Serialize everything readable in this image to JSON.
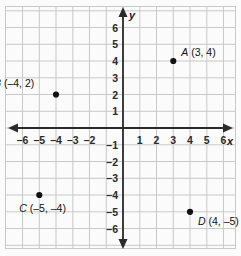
{
  "figure": {
    "type": "coordinate-plane",
    "background_color": "#fbfbfb",
    "grid_color": "#c9c9c9",
    "axis_color": "#2b2b2b",
    "point_color": "#111111",
    "axis_labels": {
      "x": "x",
      "y": "y"
    }
  },
  "chart_data": {
    "type": "scatter",
    "title": "",
    "xlabel": "x",
    "ylabel": "y",
    "xlim": [
      -7,
      7
    ],
    "ylim": [
      -7,
      7
    ],
    "grid": true,
    "legend": "none",
    "x_ticks": [
      "–6",
      "–5",
      "–4",
      "–3",
      "–2",
      "1",
      "2",
      "3",
      "4",
      "5",
      "6"
    ],
    "x_tick_values": [
      -6,
      -5,
      -4,
      -3,
      -2,
      1,
      2,
      3,
      4,
      5,
      6
    ],
    "y_ticks": [
      "6",
      "5",
      "4",
      "3",
      "2",
      "1",
      "–1",
      "–2",
      "–3",
      "–4",
      "–5",
      "–6"
    ],
    "y_tick_values": [
      6,
      5,
      4,
      3,
      2,
      1,
      -1,
      -2,
      -3,
      -4,
      -5,
      -6
    ],
    "points": [
      {
        "name": "A",
        "label": "A (3, 4)",
        "label_name": "A",
        "label_coords": "(3, 4)",
        "x": 3,
        "y": 4,
        "label_position": "right"
      },
      {
        "name": "B",
        "label": "B (–4, 2)",
        "label_name": "B",
        "label_coords": "(–4, 2)",
        "x": -4,
        "y": 2,
        "label_position": "above-left"
      },
      {
        "name": "C",
        "label": "C (–5, –4)",
        "label_name": "C",
        "label_coords": "(–5, –4)",
        "x": -5,
        "y": -4,
        "label_position": "below-left"
      },
      {
        "name": "D",
        "label": "D (4, –5)",
        "label_name": "D",
        "label_coords": "(4, –5)",
        "x": 4,
        "y": -5,
        "label_position": "below-right"
      }
    ]
  }
}
